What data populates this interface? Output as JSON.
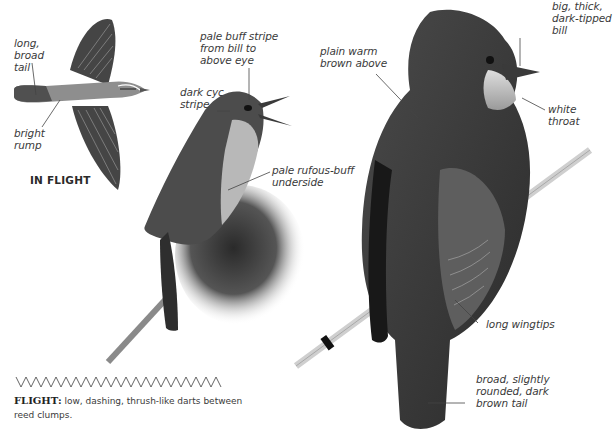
{
  "figure": {
    "background_color": "#ffffff",
    "ink_color": "#3a3a3a"
  },
  "flight_bird": {
    "labels": {
      "tail": "long,\nbroad\ntail",
      "rump": "bright\nrump"
    },
    "caption": "IN FLIGHT"
  },
  "perched_bird_small": {
    "labels": {
      "supercilium": "pale buff stripe\nfrom bill to\nabove eye",
      "eye_stripe": "dark cyc\nstripe",
      "underside": "pale rufous-buff\nunderside"
    }
  },
  "perched_bird_large": {
    "labels": {
      "upperparts": "plain warm\nbrown above",
      "bill": "big, thick,\ndark-tipped\nbill",
      "throat": "white\nthroat",
      "wingtips": "long wingtips",
      "tail": "broad, slightly\nrounded, dark\nbrown tail"
    }
  },
  "flight_pattern": {
    "icon": "zigzag-flight-path-icon",
    "heading": "FLIGHT:",
    "description": "low, dashing, thrush-like darts between reed clumps."
  }
}
